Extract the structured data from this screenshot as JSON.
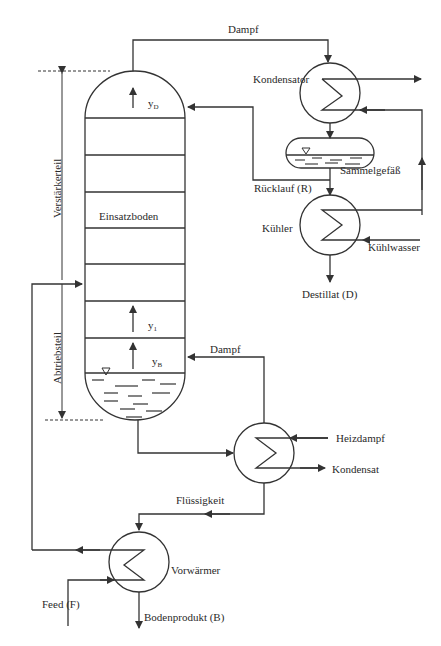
{
  "diagram": {
    "column": {
      "sections": {
        "upper": "Verstärkerteil",
        "lower": "Abtriebsteil"
      },
      "feed_tray_label": "Einsatzboden",
      "vapor_labels": {
        "top": "y",
        "top_sub": "D",
        "tray1": "y",
        "tray1_sub": "1",
        "bottom": "y",
        "bottom_sub": "B"
      }
    },
    "equipment": {
      "condenser": "Kondensator",
      "collector": "Sammelgefäß",
      "cooler": "Kühler",
      "preheater": "Vorwärmer"
    },
    "streams": {
      "top_vapor": "Dampf",
      "reflux": "Rücklauf (R)",
      "cooling_water": "Kühlwasser",
      "distillate": "Destillat (D)",
      "reboiler_vapor": "Dampf",
      "heating_steam": "Heizdampf",
      "condensate": "Kondensat",
      "liquid": "Flüssigkeit",
      "feed": "Feed (F)",
      "bottoms": "Bodenprodukt (B)"
    },
    "colors": {
      "line": "#333333",
      "background": "#ffffff"
    }
  }
}
